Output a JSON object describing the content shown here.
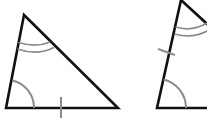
{
  "figure": {
    "colors": {
      "edge": "#111111",
      "marking": "#8a8a8a",
      "background": "#ffffff"
    },
    "triangles": [
      {
        "id": "triangle-1",
        "vertices": {
          "top": [
            24,
            15
          ],
          "bottom_left": [
            6,
            108
          ],
          "bottom_right": [
            118,
            108
          ]
        },
        "markings": {
          "single_arc_angle": "bottom_left",
          "double_arc_angle": "top",
          "tick_side": "base"
        }
      },
      {
        "id": "triangle-2",
        "vertices": {
          "top": [
            181,
            0
          ],
          "bottom_left": [
            157,
            108
          ],
          "bottom_right": [
            230,
            108
          ]
        },
        "markings": {
          "single_arc_angle": "bottom_left",
          "double_arc_angle": "top",
          "tick_side": "left"
        }
      }
    ]
  }
}
